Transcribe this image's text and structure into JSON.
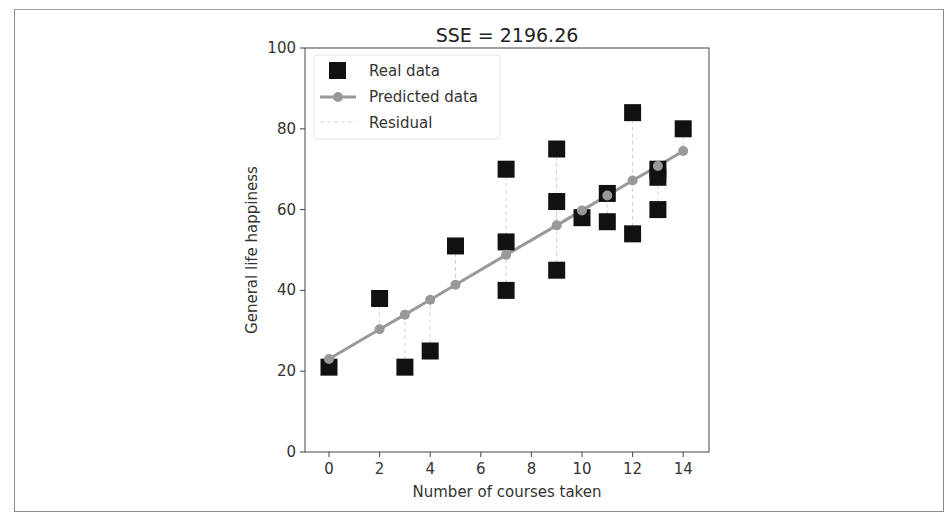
{
  "figure": {
    "title": "SSE = 2196.26"
  },
  "legend": {
    "items": [
      {
        "label": "Real data",
        "marker": "square"
      },
      {
        "label": "Predicted data",
        "marker": "line-circle"
      },
      {
        "label": "Residual",
        "marker": "dashed-line"
      }
    ]
  },
  "colors": {
    "real": "#111111",
    "predicted": "#999999",
    "residual": "#d0d0d0",
    "axis": "#444444"
  },
  "chart_data": {
    "type": "scatter",
    "title": "SSE = 2196.26",
    "xlabel": "Number of courses taken",
    "ylabel": "General life happiness",
    "xlim": [
      -1,
      15
    ],
    "ylim": [
      0,
      100
    ],
    "xticks": [
      0,
      2,
      4,
      6,
      8,
      10,
      12,
      14
    ],
    "yticks": [
      0,
      20,
      40,
      60,
      80,
      100
    ],
    "grid": false,
    "legend_position": "upper left",
    "series": [
      {
        "name": "Real data",
        "type": "scatter",
        "marker": "square",
        "points": [
          [
            0,
            21
          ],
          [
            2,
            38
          ],
          [
            3,
            21
          ],
          [
            4,
            25
          ],
          [
            5,
            51
          ],
          [
            7,
            70
          ],
          [
            7,
            52
          ],
          [
            7,
            40
          ],
          [
            9,
            75
          ],
          [
            9,
            62
          ],
          [
            9,
            45
          ],
          [
            10,
            58
          ],
          [
            11,
            64
          ],
          [
            11,
            57
          ],
          [
            12,
            84
          ],
          [
            12,
            54
          ],
          [
            13,
            70
          ],
          [
            13,
            68
          ],
          [
            13,
            60
          ],
          [
            14,
            80
          ]
        ]
      },
      {
        "name": "Predicted data",
        "type": "line",
        "marker": "circle",
        "points": [
          [
            0,
            23.0
          ],
          [
            2,
            30.4
          ],
          [
            3,
            34.0
          ],
          [
            4,
            37.7
          ],
          [
            5,
            41.4
          ],
          [
            7,
            48.8
          ],
          [
            9,
            56.1
          ],
          [
            10,
            59.8
          ],
          [
            11,
            63.5
          ],
          [
            12,
            67.2
          ],
          [
            13,
            70.8
          ],
          [
            14,
            74.5
          ]
        ]
      },
      {
        "name": "Residual",
        "type": "dashed-vertical-segments",
        "description": "vertical dashed line from each real data point to predicted value at same x"
      }
    ],
    "sse": 2196.26
  }
}
